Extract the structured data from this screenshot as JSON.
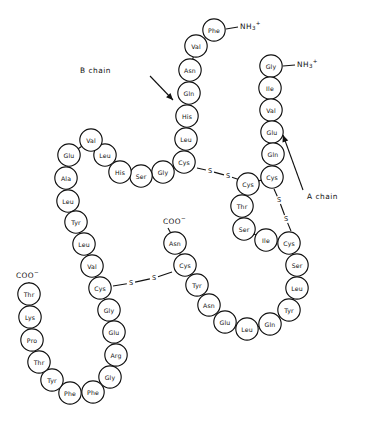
{
  "figure": {
    "background_color": "#ffffff",
    "stroke_color": "#111111",
    "width": 366,
    "height": 433
  },
  "annotations": {
    "b_chain_label": "B chain",
    "a_chain_label": "A chain",
    "b_chain_label_pos": {
      "x": 111,
      "y": 70
    },
    "a_chain_label_pos": {
      "x": 307,
      "y": 196
    },
    "b_chain_arrow": {
      "x1": 150,
      "y1": 76,
      "x2": 173,
      "y2": 100
    },
    "a_chain_arrow": {
      "x1": 303,
      "y1": 190,
      "x2": 283,
      "y2": 135
    }
  },
  "termini": [
    {
      "id": "b-chain-n-terminus",
      "text": "NH",
      "sub": "3",
      "sup": "+",
      "x": 240,
      "y": 26,
      "bond": {
        "x1": 226,
        "y1": 29,
        "x2": 238,
        "y2": 27
      }
    },
    {
      "id": "a-chain-n-terminus",
      "text": "NH",
      "sub": "3",
      "sup": "+",
      "x": 297,
      "y": 64,
      "bond": {
        "x1": 283,
        "y1": 66,
        "x2": 295,
        "y2": 65
      }
    },
    {
      "id": "a-chain-c-terminus",
      "text": "COO",
      "sub": "",
      "sup": "−",
      "x": 163,
      "y": 221,
      "bond": {
        "x1": 168,
        "y1": 228,
        "x2": 175,
        "y2": 241
      }
    },
    {
      "id": "b-chain-c-terminus",
      "text": "COO",
      "sub": "",
      "sup": "−",
      "x": 16,
      "y": 275,
      "bond": {
        "x1": 29,
        "y1": 282,
        "x2": 29,
        "y2": 294
      }
    }
  ],
  "chains": {
    "b_chain": {
      "name": "B chain",
      "residues": [
        {
          "label": "Phe",
          "x": 214,
          "y": 30
        },
        {
          "label": "Val",
          "x": 196,
          "y": 46
        },
        {
          "label": "Asn",
          "x": 190,
          "y": 70
        },
        {
          "label": "Gln",
          "x": 189,
          "y": 93
        },
        {
          "label": "His",
          "x": 187,
          "y": 116
        },
        {
          "label": "Leu",
          "x": 186,
          "y": 139
        },
        {
          "label": "Cys",
          "x": 184,
          "y": 162
        },
        {
          "label": "Gly",
          "x": 163,
          "y": 172
        },
        {
          "label": "Ser",
          "x": 141,
          "y": 176
        },
        {
          "label": "His",
          "x": 120,
          "y": 172
        },
        {
          "label": "Leu",
          "x": 105,
          "y": 155
        },
        {
          "label": "Val",
          "x": 91,
          "y": 140
        },
        {
          "label": "Glu",
          "x": 69,
          "y": 155
        },
        {
          "label": "Ala",
          "x": 66,
          "y": 178
        },
        {
          "label": "Leu",
          "x": 68,
          "y": 201
        },
        {
          "label": "Tyr",
          "x": 76,
          "y": 222
        },
        {
          "label": "Leu",
          "x": 84,
          "y": 244
        },
        {
          "label": "Val",
          "x": 92,
          "y": 266
        },
        {
          "label": "Cys",
          "x": 100,
          "y": 288
        },
        {
          "label": "Gly",
          "x": 109,
          "y": 310
        },
        {
          "label": "Glu",
          "x": 114,
          "y": 332
        },
        {
          "label": "Arg",
          "x": 116,
          "y": 355
        },
        {
          "label": "Gly",
          "x": 110,
          "y": 377
        },
        {
          "label": "Phe",
          "x": 93,
          "y": 392
        },
        {
          "label": "Phe",
          "x": 70,
          "y": 393
        },
        {
          "label": "Tyr",
          "x": 52,
          "y": 380
        },
        {
          "label": "Thr",
          "x": 39,
          "y": 362
        },
        {
          "label": "Pro",
          "x": 32,
          "y": 340
        },
        {
          "label": "Lys",
          "x": 30,
          "y": 317
        },
        {
          "label": "Thr",
          "x": 29,
          "y": 294
        }
      ]
    },
    "a_chain": {
      "name": "A chain",
      "residues": [
        {
          "label": "Gly",
          "x": 271,
          "y": 66
        },
        {
          "label": "Ile",
          "x": 270,
          "y": 88
        },
        {
          "label": "Val",
          "x": 271,
          "y": 110
        },
        {
          "label": "Glu",
          "x": 272,
          "y": 132
        },
        {
          "label": "Gln",
          "x": 273,
          "y": 154
        },
        {
          "label": "Cys",
          "x": 272,
          "y": 177
        },
        {
          "label": "Cys",
          "x": 248,
          "y": 184
        },
        {
          "label": "Thr",
          "x": 242,
          "y": 206
        },
        {
          "label": "Ser",
          "x": 244,
          "y": 229
        },
        {
          "label": "Ile",
          "x": 266,
          "y": 240
        },
        {
          "label": "Cys",
          "x": 289,
          "y": 243
        },
        {
          "label": "Ser",
          "x": 297,
          "y": 265
        },
        {
          "label": "Leu",
          "x": 297,
          "y": 288
        },
        {
          "label": "Tyr",
          "x": 289,
          "y": 310
        },
        {
          "label": "Gln",
          "x": 270,
          "y": 324
        },
        {
          "label": "Leu",
          "x": 247,
          "y": 329
        },
        {
          "label": "Glu",
          "x": 225,
          "y": 322
        },
        {
          "label": "Asn",
          "x": 209,
          "y": 305
        },
        {
          "label": "Tyr",
          "x": 197,
          "y": 285
        },
        {
          "label": "Cys",
          "x": 185,
          "y": 265
        },
        {
          "label": "Asn",
          "x": 175,
          "y": 243
        }
      ]
    }
  },
  "disulfide_bridges": [
    {
      "id": "bridge-b7-a7",
      "atoms": [
        "S",
        "S"
      ],
      "from": {
        "x": 197,
        "y": 168
      },
      "to": {
        "x": 240,
        "y": 180
      },
      "atom1": {
        "x": 210,
        "y": 171
      },
      "atom2": {
        "x": 228,
        "y": 176
      }
    },
    {
      "id": "bridge-b19-a20",
      "atoms": [
        "S",
        "S"
      ],
      "from": {
        "x": 113,
        "y": 286
      },
      "to": {
        "x": 172,
        "y": 272
      },
      "atom1": {
        "x": 131,
        "y": 283
      },
      "atom2": {
        "x": 154,
        "y": 278
      }
    },
    {
      "id": "bridge-a6-a11",
      "atoms": [
        "S",
        "S"
      ],
      "from": {
        "x": 274,
        "y": 189
      },
      "to": {
        "x": 291,
        "y": 231
      },
      "atom1": {
        "x": 279,
        "y": 200
      },
      "atom2": {
        "x": 286,
        "y": 219
      }
    }
  ],
  "geometry": {
    "residue_radius": 11.2
  }
}
